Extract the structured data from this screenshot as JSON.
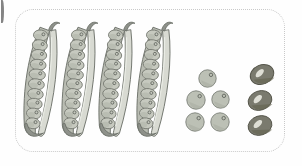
{
  "scene": {
    "title": "Pea pods and loose seeds illustration",
    "canvas": {
      "width": 302,
      "height": 166,
      "background": "#fefefe"
    },
    "frame": {
      "name": "dotted-rounded-rectangle",
      "style": "dotted",
      "color": "#c9c9c9",
      "radius": 18,
      "x": 15,
      "y": 9,
      "width": 270,
      "height": 143
    },
    "edge_marker": {
      "name": "cut-off-badge",
      "color": "#6e6e6e",
      "x": 1,
      "y": 0,
      "width": 3,
      "height": 23
    }
  },
  "counts": {
    "pods": 4,
    "peas_per_pod": 10,
    "loose_light_peas": 5,
    "dark_beans": 3
  },
  "colors": {
    "pod_shell_light": "#d8dad2",
    "pod_shell_mid": "#b9bcb2",
    "pod_shell_dark": "#8e918a",
    "pod_outline": "#6f736c",
    "pea_light": "#c6c9bf",
    "pea_mid": "#aeb2a7",
    "pea_outline": "#73776f",
    "hilum_dark": "#6a6e66",
    "bean_dark": "#7a7a6e",
    "bean_dark_shade": "#63634f",
    "bean_outline": "#55554a",
    "bean_hilum": "#e6e6dd",
    "loose_pea_fill": "#bcc0b5",
    "loose_pea_shade": "#a7aba0",
    "loose_pea_outline": "#7b7f77",
    "highlight": "#eceee8"
  },
  "groups": [
    {
      "name": "pod-group",
      "label": "Four open pea pods",
      "members": [
        {
          "name": "pod-1",
          "x": 18,
          "y": 16,
          "rotation": 9,
          "peas": 10
        },
        {
          "name": "pod-2",
          "x": 56,
          "y": 16,
          "rotation": 9,
          "peas": 10
        },
        {
          "name": "pod-3",
          "x": 93,
          "y": 16,
          "rotation": 9,
          "peas": 10
        },
        {
          "name": "pod-4",
          "x": 131,
          "y": 16,
          "rotation": 9,
          "peas": 10
        }
      ]
    },
    {
      "name": "loose-pea-group",
      "label": "Five loose round peas",
      "members": [
        {
          "name": "loose-pea-1",
          "x": 198,
          "y": 69,
          "size": 19
        },
        {
          "name": "loose-pea-2",
          "x": 186,
          "y": 90,
          "size": 20
        },
        {
          "name": "loose-pea-3",
          "x": 211,
          "y": 90,
          "size": 19
        },
        {
          "name": "loose-pea-4",
          "x": 185,
          "y": 112,
          "size": 20
        },
        {
          "name": "loose-pea-5",
          "x": 210,
          "y": 112,
          "size": 20
        }
      ]
    },
    {
      "name": "bean-group",
      "label": "Three dark beans",
      "members": [
        {
          "name": "bean-1",
          "x": 249,
          "y": 64,
          "width": 26,
          "height": 21,
          "rotation": -22
        },
        {
          "name": "bean-2",
          "x": 247,
          "y": 90,
          "width": 26,
          "height": 21,
          "rotation": -20
        },
        {
          "name": "bean-3",
          "x": 247,
          "y": 115,
          "width": 26,
          "height": 21,
          "rotation": -18
        }
      ]
    }
  ]
}
